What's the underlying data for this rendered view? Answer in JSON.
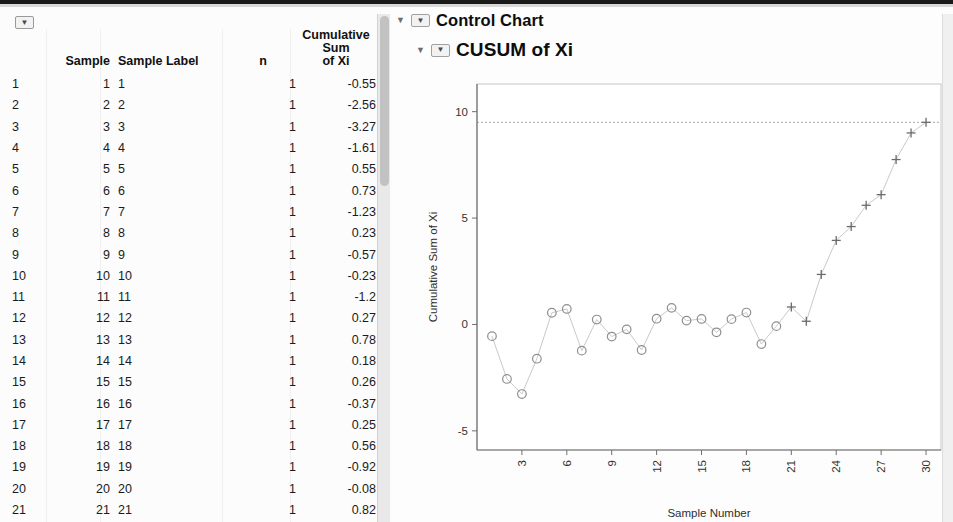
{
  "window": {
    "table_toggle_glyph": "▼",
    "disclosure_glyph": "▼",
    "node_glyph": "▼"
  },
  "table": {
    "headers": {
      "index": "",
      "sample": "Sample",
      "sample_label": "Sample Label",
      "n": "n",
      "cumulative_sum": "Cumulative Sum\nof Xi"
    },
    "rows": [
      {
        "index": "1",
        "sample": "1",
        "label": "1",
        "n": "1",
        "cum": "-0.55"
      },
      {
        "index": "2",
        "sample": "2",
        "label": "2",
        "n": "1",
        "cum": "-2.56"
      },
      {
        "index": "3",
        "sample": "3",
        "label": "3",
        "n": "1",
        "cum": "-3.27"
      },
      {
        "index": "4",
        "sample": "4",
        "label": "4",
        "n": "1",
        "cum": "-1.61"
      },
      {
        "index": "5",
        "sample": "5",
        "label": "5",
        "n": "1",
        "cum": "0.55"
      },
      {
        "index": "6",
        "sample": "6",
        "label": "6",
        "n": "1",
        "cum": "0.73"
      },
      {
        "index": "7",
        "sample": "7",
        "label": "7",
        "n": "1",
        "cum": "-1.23"
      },
      {
        "index": "8",
        "sample": "8",
        "label": "8",
        "n": "1",
        "cum": "0.23"
      },
      {
        "index": "9",
        "sample": "9",
        "label": "9",
        "n": "1",
        "cum": "-0.57"
      },
      {
        "index": "10",
        "sample": "10",
        "label": "10",
        "n": "1",
        "cum": "-0.23"
      },
      {
        "index": "11",
        "sample": "11",
        "label": "11",
        "n": "1",
        "cum": "-1.2"
      },
      {
        "index": "12",
        "sample": "12",
        "label": "12",
        "n": "1",
        "cum": "0.27"
      },
      {
        "index": "13",
        "sample": "13",
        "label": "13",
        "n": "1",
        "cum": "0.78"
      },
      {
        "index": "14",
        "sample": "14",
        "label": "14",
        "n": "1",
        "cum": "0.18"
      },
      {
        "index": "15",
        "sample": "15",
        "label": "15",
        "n": "1",
        "cum": "0.26"
      },
      {
        "index": "16",
        "sample": "16",
        "label": "16",
        "n": "1",
        "cum": "-0.37"
      },
      {
        "index": "17",
        "sample": "17",
        "label": "17",
        "n": "1",
        "cum": "0.25"
      },
      {
        "index": "18",
        "sample": "18",
        "label": "18",
        "n": "1",
        "cum": "0.56"
      },
      {
        "index": "19",
        "sample": "19",
        "label": "19",
        "n": "1",
        "cum": "-0.92"
      },
      {
        "index": "20",
        "sample": "20",
        "label": "20",
        "n": "1",
        "cum": "-0.08"
      },
      {
        "index": "21",
        "sample": "21",
        "label": "21",
        "n": "1",
        "cum": "0.82"
      },
      {
        "index": "22",
        "sample": "22",
        "label": "22",
        "n": "1",
        "cum": "0.15"
      }
    ]
  },
  "outline": {
    "control_chart": "Control Chart",
    "cusum": "CUSUM of Xi"
  },
  "chart_data": {
    "type": "line",
    "title": "CUSUM of Xi",
    "xlabel": "Sample Number",
    "ylabel": "Cumulative Sum of Xi",
    "xlim": [
      0,
      31
    ],
    "ylim": [
      -5.9,
      11.3
    ],
    "xticks": [
      3,
      6,
      9,
      12,
      15,
      18,
      21,
      24,
      27,
      30
    ],
    "yticks": [
      -5,
      0,
      5,
      10
    ],
    "xtick_rotation": -90,
    "grid": false,
    "legend": false,
    "marker_in_control": "open-circle",
    "marker_out_of_control": "plus",
    "control_limit": {
      "label": "UCL",
      "value": 9.5,
      "style": "dotted"
    },
    "x": [
      1,
      2,
      3,
      4,
      5,
      6,
      7,
      8,
      9,
      10,
      11,
      12,
      13,
      14,
      15,
      16,
      17,
      18,
      19,
      20,
      21,
      22,
      23,
      24,
      25,
      26,
      27,
      28,
      29,
      30
    ],
    "values": [
      -0.55,
      -2.56,
      -3.27,
      -1.61,
      0.55,
      0.73,
      -1.23,
      0.23,
      -0.57,
      -0.23,
      -1.2,
      0.27,
      0.78,
      0.18,
      0.26,
      -0.37,
      0.25,
      0.56,
      -0.92,
      -0.08,
      0.82,
      0.15,
      2.35,
      3.95,
      4.6,
      5.6,
      6.1,
      7.75,
      9.0,
      9.5
    ],
    "out_of_control_from": 21,
    "line_color": "#c9c9c9",
    "marker_color": "#8f8f8f",
    "axis_color": "#6f6f6f"
  }
}
